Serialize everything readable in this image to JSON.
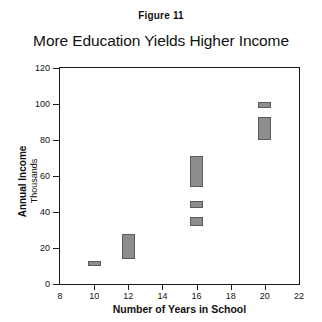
{
  "figure": {
    "number_label": "Figure 11",
    "title": "More Education Yields Higher Income"
  },
  "axes": {
    "y_caption_main": "Annual Income",
    "y_caption_sub": "Thousands",
    "x_caption": "Number of Years in School"
  },
  "chart_data": {
    "type": "bar",
    "title": "More Education Yields Higher Income",
    "subtitle": "Figure 11",
    "xlabel": "Number of Years in School",
    "ylabel": "Annual Income",
    "ylabel_sub": "Thousands",
    "xlim": [
      8,
      22
    ],
    "ylim": [
      0,
      120
    ],
    "xticks": [
      8,
      10,
      12,
      14,
      16,
      18,
      20,
      22
    ],
    "xtick_labels": [
      "8",
      "10",
      "12",
      "14",
      "16",
      "18",
      "20",
      "22"
    ],
    "yticks": [
      0,
      20,
      40,
      60,
      80,
      100,
      120
    ],
    "ytick_labels": [
      "0",
      "20",
      "40",
      "60",
      "80",
      "100",
      "120"
    ],
    "grid": false,
    "legend": "none",
    "bar_color": "#8d8d8d",
    "bar_edge_color": "#5a5a5a",
    "bars": [
      {
        "x": 10,
        "low": 10,
        "high": 13
      },
      {
        "x": 12,
        "low": 14,
        "high": 28
      },
      {
        "x": 16,
        "low": 32,
        "high": 37
      },
      {
        "x": 16,
        "low": 42,
        "high": 46
      },
      {
        "x": 16,
        "low": 54,
        "high": 71
      },
      {
        "x": 20,
        "low": 80,
        "high": 93
      },
      {
        "x": 20,
        "low": 98,
        "high": 101
      }
    ]
  }
}
